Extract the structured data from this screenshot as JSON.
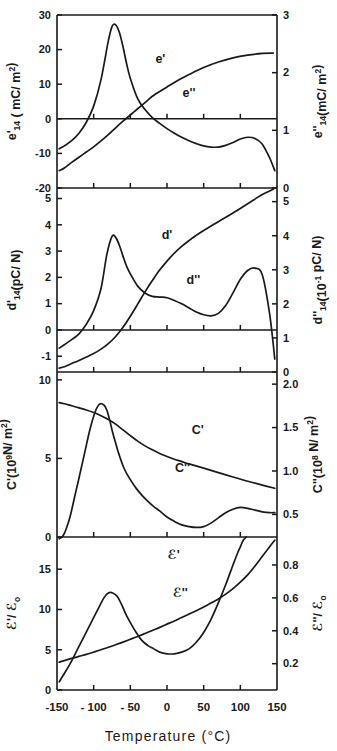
{
  "figure": {
    "xaxis": {
      "title": "Temperature (°C)",
      "unit": "°C",
      "min": -150,
      "max": 150,
      "ticks": [
        -150,
        -100,
        -50,
        0,
        50,
        100,
        150
      ],
      "tick_labels": [
        "-150",
        "- 100",
        "- 50",
        "0",
        "50",
        "100",
        "150"
      ]
    },
    "panels": [
      {
        "id": "panel-e",
        "left_axis": {
          "symbol": "e'",
          "subscript": "14",
          "unit": "( mC/ m²)",
          "label": "e'₁₄ ( mC/ m²)",
          "min": -20,
          "max": 30,
          "ticks": [
            -20,
            -10,
            0,
            10,
            20,
            30
          ],
          "tick_labels": [
            "-20",
            "-10",
            "0",
            "10",
            "20",
            "30"
          ]
        },
        "right_axis": {
          "symbol": "e''",
          "subscript": "14",
          "unit": "(mC/ m²)",
          "label": "e''₁₄ (mC/ m²)",
          "min": 0,
          "max": 3,
          "ticks": [
            0,
            1,
            2,
            3
          ],
          "tick_labels": [
            "0",
            "1",
            "2",
            "3"
          ]
        },
        "curve_labels": [
          "e'",
          "e''"
        ]
      },
      {
        "id": "panel-d",
        "left_axis": {
          "symbol": "d'",
          "subscript": "14",
          "unit": "(pC/ N)",
          "label": "d'₁₄(pC/ N)",
          "min": -1.6,
          "max": 5.4,
          "ticks": [
            -1,
            0,
            1,
            2,
            3,
            4,
            5
          ],
          "tick_labels": [
            "-1",
            "0",
            "1",
            "2",
            "3",
            "4",
            "5"
          ]
        },
        "right_axis": {
          "symbol": "d''",
          "subscript": "14",
          "unit": "(10⁻¹ pC/ N)",
          "label": "d''₁₄(10⁻¹ pC/ N)",
          "min": 0,
          "max": 5.4,
          "ticks": [
            0,
            1,
            2,
            3,
            4,
            5
          ],
          "tick_labels": [
            "0",
            "1",
            "2",
            "3",
            "4",
            "5"
          ]
        },
        "curve_labels": [
          "d'",
          "d''"
        ]
      },
      {
        "id": "panel-C",
        "left_axis": {
          "symbol": "C'",
          "unit": "(10⁹N/ m²)",
          "label": "C'(10⁹N/ m²)",
          "min": 0,
          "max": 10.5,
          "ticks": [
            0,
            5,
            10
          ],
          "tick_labels": [
            "0",
            "5",
            "10"
          ]
        },
        "right_axis": {
          "symbol": "C''",
          "unit": "(10⁸ N/ m²)",
          "label": "C''(10⁸ N/ m²)",
          "min": 0.24,
          "max": 2.14,
          "ticks": [
            0.5,
            1.0,
            1.5,
            2.0
          ],
          "tick_labels": [
            "0.5",
            "1.0",
            "1.5",
            "2.0"
          ]
        },
        "curve_labels": [
          "C'",
          "C''"
        ]
      },
      {
        "id": "panel-eps",
        "left_axis": {
          "symbol": "ℰ'",
          "unit": "/ ℰ₀",
          "label": "ℰ'/ ℰ₀",
          "min": 0,
          "max": 19,
          "ticks": [
            0,
            5,
            10,
            15
          ],
          "tick_labels": [
            "0",
            "5",
            "10",
            "15"
          ]
        },
        "right_axis": {
          "symbol": "ℰ''",
          "unit": "/ ℰ₀",
          "label": "ℰ''/ ℰ₀",
          "min": 0.04,
          "max": 0.97,
          "ticks": [
            0.2,
            0.4,
            0.6,
            0.8
          ],
          "tick_labels": [
            "0.2",
            "0.4",
            "0.6",
            "0.8"
          ]
        },
        "curve_labels": [
          "ℰ'",
          "ℰ''"
        ]
      }
    ]
  },
  "chart_data": {
    "type": "line",
    "title": "",
    "xlabel": "Temperature (°C)",
    "grid": false,
    "legend": "inline-curve-labels",
    "subplots": [
      {
        "name": "panel-e",
        "ylabel": "e'14 ( mC/ m2)",
        "ylabel_right": "e''14 (mC/ m2)",
        "ylim": [
          -20,
          30
        ],
        "ylim_right": [
          0,
          3
        ],
        "series": [
          {
            "name": "e'",
            "axis": "left",
            "x": [
              -147,
              -140,
              -130,
              -120,
              -110,
              -100,
              -90,
              -80,
              -70,
              -60,
              -50,
              -40,
              -30,
              -25,
              -20,
              -10,
              0,
              10,
              20,
              30,
              50,
              70,
              90,
              110,
              130,
              145
            ],
            "y": [
              -15.0,
              -14.2,
              -12.6,
              -11.1,
              -9.6,
              -8.1,
              -6.4,
              -4.6,
              -2.6,
              -0.7,
              1.1,
              2.9,
              4.7,
              5.6,
              6.5,
              7.9,
              9.2,
              10.5,
              11.7,
              12.8,
              14.8,
              16.4,
              17.6,
              18.4,
              18.9,
              19.0
            ]
          },
          {
            "name": "e''",
            "axis": "right",
            "x": [
              -147,
              -140,
              -130,
              -120,
              -110,
              -100,
              -90,
              -80,
              -75,
              -70,
              -65,
              -60,
              -55,
              -50,
              -40,
              -30,
              -20,
              -10,
              0,
              10,
              20,
              30,
              40,
              50,
              60,
              70,
              80,
              90,
              100,
              110,
              120,
              130,
              140,
              147
            ],
            "y": [
              0.68,
              0.73,
              0.82,
              0.95,
              1.14,
              1.42,
              1.88,
              2.55,
              2.8,
              2.83,
              2.7,
              2.45,
              2.15,
              1.9,
              1.55,
              1.36,
              1.22,
              1.12,
              1.03,
              0.95,
              0.88,
              0.82,
              0.77,
              0.73,
              0.71,
              0.71,
              0.74,
              0.79,
              0.85,
              0.88,
              0.86,
              0.76,
              0.52,
              0.3
            ]
          }
        ]
      },
      {
        "name": "panel-d",
        "ylabel": "d'14(pC/ N)",
        "ylabel_right": "d''14(10-1 pC/ N)",
        "ylim": [
          -1.6,
          5.4
        ],
        "ylim_right": [
          0,
          5.4
        ],
        "series": [
          {
            "name": "d'",
            "axis": "left",
            "x": [
              -147,
              -140,
              -130,
              -120,
              -110,
              -100,
              -90,
              -80,
              -70,
              -60,
              -50,
              -40,
              -30,
              -20,
              -10,
              0,
              10,
              20,
              30,
              40,
              50,
              70,
              90,
              110,
              130,
              145
            ],
            "y": [
              -1.45,
              -1.4,
              -1.28,
              -1.16,
              -1.03,
              -0.9,
              -0.73,
              -0.52,
              -0.25,
              0.1,
              0.52,
              0.98,
              1.45,
              1.88,
              2.28,
              2.62,
              2.92,
              3.18,
              3.4,
              3.6,
              3.78,
              4.12,
              4.45,
              4.8,
              5.15,
              5.35
            ]
          },
          {
            "name": "d''",
            "axis": "right",
            "x": [
              -147,
              -140,
              -130,
              -120,
              -110,
              -100,
              -90,
              -82,
              -75,
              -70,
              -65,
              -60,
              -55,
              -50,
              -40,
              -30,
              -20,
              -10,
              0,
              10,
              20,
              30,
              40,
              50,
              60,
              70,
              80,
              90,
              100,
              110,
              120,
              130,
              140,
              147
            ],
            "y": [
              0.7,
              0.8,
              0.95,
              1.12,
              1.4,
              1.8,
              2.45,
              3.45,
              3.98,
              3.95,
              3.72,
              3.4,
              3.1,
              2.88,
              2.52,
              2.32,
              2.22,
              2.2,
              2.18,
              2.1,
              2.0,
              1.88,
              1.76,
              1.68,
              1.65,
              1.72,
              1.95,
              2.32,
              2.72,
              2.98,
              3.05,
              2.85,
              1.7,
              0.38
            ]
          }
        ]
      },
      {
        "name": "panel-C",
        "ylabel": "C'(109N/ m2)",
        "ylabel_right": "C''(108 N/ m2)",
        "ylim": [
          0,
          10.5
        ],
        "ylim_right": [
          0.24,
          2.14
        ],
        "series": [
          {
            "name": "C'",
            "axis": "left",
            "x": [
              -147,
              -140,
              -130,
              -120,
              -110,
              -100,
              -90,
              -80,
              -70,
              -60,
              -50,
              -40,
              -30,
              -20,
              -10,
              0,
              10,
              20,
              30,
              50,
              70,
              90,
              110,
              130,
              147
            ],
            "y": [
              8.55,
              8.48,
              8.35,
              8.22,
              8.08,
              7.92,
              7.72,
              7.48,
              7.18,
              6.82,
              6.45,
              6.1,
              5.8,
              5.55,
              5.32,
              5.12,
              4.95,
              4.8,
              4.65,
              4.38,
              4.1,
              3.82,
              3.55,
              3.3,
              3.1
            ]
          },
          {
            "name": "C''",
            "axis": "right",
            "x": [
              -147,
              -142,
              -138,
              -132,
              -126,
              -120,
              -112,
              -105,
              -98,
              -92,
              -86,
              -82,
              -78,
              -74,
              -70,
              -65,
              -58,
              -50,
              -42,
              -34,
              -26,
              -18,
              -10,
              0,
              10,
              20,
              30,
              40,
              50,
              60,
              70,
              80,
              90,
              100,
              110,
              120,
              130,
              140,
              147
            ],
            "y": [
              0.22,
              0.25,
              0.32,
              0.48,
              0.7,
              0.92,
              1.22,
              1.48,
              1.68,
              1.77,
              1.76,
              1.7,
              1.58,
              1.44,
              1.32,
              1.18,
              1.02,
              0.9,
              0.8,
              0.72,
              0.65,
              0.59,
              0.54,
              0.47,
              0.42,
              0.38,
              0.36,
              0.35,
              0.36,
              0.4,
              0.46,
              0.52,
              0.56,
              0.58,
              0.57,
              0.55,
              0.53,
              0.52,
              0.52
            ]
          }
        ]
      },
      {
        "name": "panel-eps",
        "ylabel": "E'/ Eo",
        "ylabel_right": "E''/ Eo",
        "ylim": [
          0,
          19
        ],
        "ylim_right": [
          0.04,
          0.97
        ],
        "series": [
          {
            "name": "eps'",
            "axis": "left",
            "x": [
              -147,
              -140,
              -130,
              -120,
              -110,
              -100,
              -90,
              -80,
              -70,
              -60,
              -50,
              -40,
              -30,
              -20,
              -10,
              0,
              10,
              20,
              30,
              40,
              50,
              60,
              70,
              80,
              90,
              100,
              110,
              120,
              130,
              140,
              147
            ],
            "y": [
              3.45,
              3.65,
              3.92,
              4.18,
              4.42,
              4.7,
              5.0,
              5.3,
              5.62,
              5.95,
              6.3,
              6.65,
              7.02,
              7.4,
              7.78,
              8.18,
              8.58,
              9.0,
              9.42,
              9.85,
              10.3,
              10.8,
              11.3,
              11.9,
              12.6,
              13.4,
              14.3,
              15.4,
              16.6,
              17.8,
              18.6
            ]
          },
          {
            "name": "eps''",
            "axis": "right",
            "x": [
              -147,
              -140,
              -132,
              -124,
              -116,
              -108,
              -100,
              -92,
              -86,
              -80,
              -74,
              -68,
              -62,
              -56,
              -50,
              -42,
              -34,
              -26,
              -18,
              -10,
              0,
              10,
              20,
              30,
              40,
              50,
              60,
              70,
              80,
              90,
              96,
              100,
              104,
              108
            ],
            "y": [
              0.09,
              0.14,
              0.2,
              0.27,
              0.34,
              0.41,
              0.48,
              0.55,
              0.6,
              0.63,
              0.63,
              0.61,
              0.56,
              0.5,
              0.45,
              0.39,
              0.34,
              0.31,
              0.29,
              0.27,
              0.26,
              0.26,
              0.27,
              0.29,
              0.33,
              0.39,
              0.47,
              0.57,
              0.68,
              0.8,
              0.87,
              0.91,
              0.95,
              0.97
            ]
          }
        ]
      }
    ]
  }
}
